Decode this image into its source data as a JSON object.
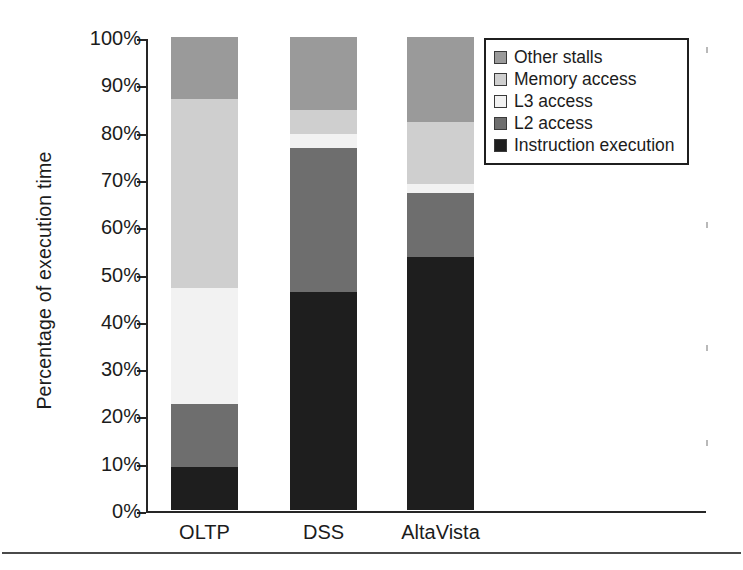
{
  "chart_data": {
    "type": "bar",
    "subtype": "stacked-bar-100-percent",
    "title": "",
    "xlabel": "",
    "ylabel": "Percentage  of execution time",
    "ylim": [
      0,
      100
    ],
    "grid": false,
    "legend_position": "top-right",
    "categories": [
      "OLTP",
      "DSS",
      "AltaVista"
    ],
    "ytick_labels": [
      "100%",
      "90%",
      "80%",
      "70%",
      "60%",
      "50%",
      "40%",
      "30%",
      "20%",
      "10%",
      "0%"
    ],
    "ytick_values": [
      100,
      90,
      80,
      70,
      60,
      50,
      40,
      30,
      20,
      10,
      0
    ],
    "stack_order_bottom_to_top": [
      "Instruction execution",
      "L2 access",
      "L3 access",
      "Memory access",
      "Other stalls"
    ],
    "series": [
      {
        "name": "Instruction execution",
        "color": "#1e1e1e",
        "values": [
          9.0,
          46.0,
          53.5
        ]
      },
      {
        "name": "L2 access",
        "color": "#6e6e6e",
        "values": [
          13.5,
          30.5,
          13.5
        ]
      },
      {
        "name": "L3 access",
        "color": "#f2f2f2",
        "values": [
          24.5,
          3.0,
          2.0
        ]
      },
      {
        "name": "Memory access",
        "color": "#cfcfcf",
        "values": [
          40.0,
          5.0,
          13.0
        ]
      },
      {
        "name": "Other stalls",
        "color": "#9a9a9a",
        "values": [
          13.0,
          15.5,
          18.0
        ]
      }
    ]
  },
  "axis": {
    "y_title": "Percentage  of execution time"
  },
  "legend": {
    "items": [
      {
        "label": "Other stalls",
        "color": "#9a9a9a"
      },
      {
        "label": "Memory access",
        "color": "#cfcfcf"
      },
      {
        "label": "L3 access",
        "color": "#f2f2f2"
      },
      {
        "label": "L2 access",
        "color": "#6e6e6e"
      },
      {
        "label": "Instruction execution",
        "color": "#1e1e1e"
      }
    ]
  }
}
